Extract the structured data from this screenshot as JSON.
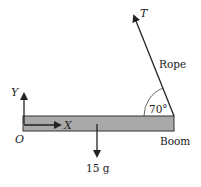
{
  "diagram": {
    "type": "free-body-diagram",
    "boom": {
      "label": "Boom",
      "fill": "#a9a9a9",
      "stroke": "#333333"
    },
    "rope": {
      "label": "Rope",
      "force_label": "T",
      "angle_label": "70°"
    },
    "axes": {
      "origin_label": "O",
      "x_label": "X",
      "y_label": "Y"
    },
    "weight": {
      "label": "15 g"
    }
  }
}
